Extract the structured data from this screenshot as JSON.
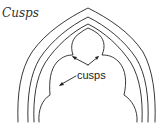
{
  "diagram": {
    "title": "Cusps",
    "label": "cusps",
    "stroke_color": "#222222",
    "background": "#ffffff"
  }
}
